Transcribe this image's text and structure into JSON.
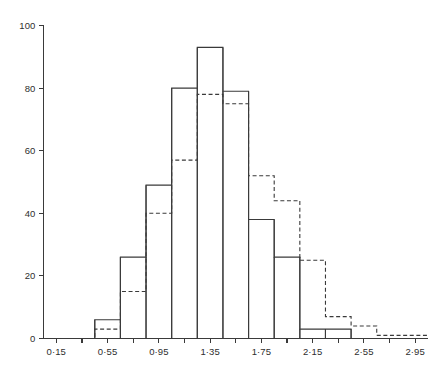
{
  "chart_data": {
    "type": "bar",
    "title": "",
    "subtitle": "",
    "xlabel": "",
    "ylabel": "",
    "xlim": [
      0.05,
      3.05
    ],
    "ylim": [
      0,
      100
    ],
    "grid": false,
    "legend_position": "none",
    "bin_width": 0.2,
    "bin_edges": [
      0.05,
      0.25,
      0.45,
      0.65,
      0.85,
      1.05,
      1.25,
      1.45,
      1.65,
      1.85,
      2.05,
      2.25,
      2.45,
      2.65,
      2.85,
      3.05
    ],
    "categories": [
      "0.05-0.25",
      "0.25-0.45",
      "0.45-0.65",
      "0.65-0.85",
      "0.85-1.05",
      "1.05-1.25",
      "1.25-1.45",
      "1.45-1.65",
      "1.65-1.85",
      "1.85-2.05",
      "2.05-2.25",
      "2.25-2.45",
      "2.45-2.65",
      "2.65-2.85",
      "2.85-3.05"
    ],
    "series": [
      {
        "name": "observed",
        "style": "solid",
        "values": [
          0,
          0,
          6,
          26,
          49,
          80,
          93,
          79,
          38,
          26,
          3,
          3,
          0,
          0,
          0
        ]
      },
      {
        "name": "expected",
        "style": "dashed",
        "values": [
          0,
          0,
          3,
          15,
          40,
          57,
          78,
          75,
          52,
          44,
          25,
          7,
          4,
          1,
          1
        ]
      }
    ],
    "y_ticks": [
      0,
      20,
      40,
      60,
      80,
      100
    ],
    "y_tick_labels": [
      "0",
      "20",
      "40",
      "60",
      "80",
      "100"
    ],
    "x_ticks": [
      0.15,
      0.35,
      0.55,
      0.75,
      0.95,
      1.15,
      1.35,
      1.55,
      1.75,
      1.95,
      2.15,
      2.35,
      2.55,
      2.75,
      2.95
    ],
    "x_tick_labels": [
      "0·15",
      "",
      "0·55",
      "",
      "0·95",
      "",
      "1·35",
      "",
      "1·75",
      "",
      "2·15",
      "",
      "2·55",
      "",
      "2·95"
    ],
    "colors": {
      "ink": "#3a3a3a",
      "text": "#2e2e2e",
      "background": "#ffffff"
    }
  }
}
